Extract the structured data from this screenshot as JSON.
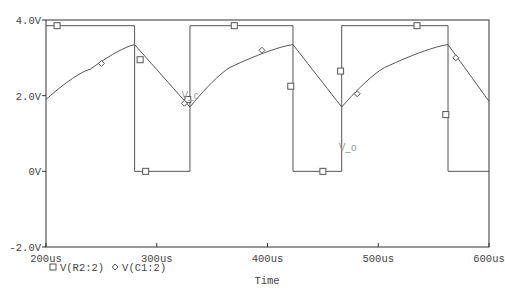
{
  "chart_data": {
    "type": "line",
    "title": "",
    "xlabel": "Time",
    "ylabel": "",
    "xlim": [
      200,
      600
    ],
    "ylim": [
      -2.0,
      4.0
    ],
    "x_unit": "us",
    "grid": false,
    "x_ticks": [
      "200us",
      "300us",
      "400us",
      "500us",
      "600us"
    ],
    "y_ticks": [
      "4.0V",
      "2.0V",
      "0V",
      "-2.0V"
    ],
    "legend": [
      {
        "marker": "square",
        "label": "V(R2:2)"
      },
      {
        "marker": "diamond",
        "label": "V(C1:2)"
      }
    ],
    "legend_position": "bottom-left",
    "annotations": [
      {
        "text": "V_c",
        "x": 325,
        "y": 1.9
      },
      {
        "text": "V_o",
        "x": 467,
        "y": 0.55
      }
    ],
    "series": [
      {
        "name": "V(R2:2)",
        "marker": "square",
        "x": [
          200,
          280,
          280,
          330,
          330,
          423,
          423,
          467,
          467,
          563,
          563,
          600
        ],
        "values": [
          3.85,
          3.85,
          0,
          0,
          3.85,
          3.85,
          0,
          0,
          3.85,
          3.85,
          0,
          0
        ]
      },
      {
        "name": "V(C1:2)",
        "marker": "diamond",
        "x": [
          200,
          240,
          280,
          330,
          370,
          423,
          467,
          510,
          563,
          600
        ],
        "values": [
          1.9,
          2.7,
          3.35,
          1.7,
          2.8,
          3.35,
          1.7,
          2.8,
          3.35,
          1.85
        ]
      }
    ]
  }
}
